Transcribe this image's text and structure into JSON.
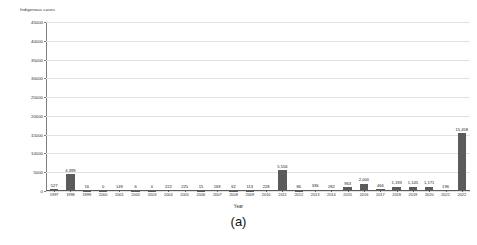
{
  "chart_data": {
    "type": "bar",
    "title": "",
    "xlabel": "Year",
    "ylabel": "Indigenous cases",
    "ylim": [
      0,
      45000
    ],
    "ytick_labels": [
      "0",
      "5000",
      "10000",
      "15000",
      "20000",
      "25000",
      "30000",
      "35000",
      "40000",
      "45000"
    ],
    "ytick_values": [
      0,
      5000,
      10000,
      15000,
      20000,
      25000,
      30000,
      35000,
      40000,
      45000
    ],
    "grid": true,
    "legend": "none",
    "bar_color": "#5b5b5b",
    "categories": [
      "1997",
      "1998",
      "1999",
      "2000",
      "2001",
      "2002",
      "2003",
      "2004",
      "2005",
      "2006",
      "2007",
      "2008",
      "2009",
      "2010",
      "2011",
      "2012",
      "2013",
      "2014",
      "2015",
      "2016",
      "2017",
      "2018",
      "2019",
      "2020",
      "2021",
      "2022"
    ],
    "values": [
      527,
      4399,
      16,
      0,
      149,
      6,
      0,
      222,
      225,
      15,
      169,
      62,
      113,
      228,
      5556,
      86,
      336,
      282,
      963,
      2000,
      466,
      1193,
      1145,
      1171,
      196,
      15458
    ],
    "value_labels": [
      "527",
      "4,399",
      "16",
      "0",
      "149",
      "6",
      "0",
      "222",
      "225",
      "15",
      "169",
      "62",
      "113",
      "228",
      "5,556",
      "86",
      "336",
      "282",
      "963",
      "2,000",
      "466",
      "1,193",
      "1,145",
      "1,171",
      "196",
      "15,458"
    ],
    "series_full": [
      {
        "year": "1997",
        "value": 527,
        "label": "527"
      },
      {
        "year": "1998",
        "value": 4399,
        "label": "4,399"
      },
      {
        "year": "1999",
        "value": 16,
        "label": "16"
      },
      {
        "year": "2000",
        "value": 0,
        "label": "0"
      },
      {
        "year": "2001",
        "value": 149,
        "label": "149"
      },
      {
        "year": "2002",
        "value": 6,
        "label": "6"
      },
      {
        "year": "2003",
        "value": 0,
        "label": "0"
      },
      {
        "year": "2004",
        "value": 222,
        "label": "222"
      },
      {
        "year": "2005",
        "value": 225,
        "label": "225"
      },
      {
        "year": "2006",
        "value": 15,
        "label": "15"
      },
      {
        "year": "2007",
        "value": 169,
        "label": "169"
      },
      {
        "year": "2008",
        "value": 62,
        "label": "62"
      },
      {
        "year": "2009",
        "value": 113,
        "label": "113"
      },
      {
        "year": "2010",
        "value": 228,
        "label": "228"
      },
      {
        "year": "2011",
        "value": 5556,
        "label": "5,556"
      },
      {
        "year": "2012",
        "value": 86,
        "label": "86"
      },
      {
        "year": "2013",
        "value": 336,
        "label": "336"
      },
      {
        "year": "2014",
        "value": 282,
        "label": "282"
      },
      {
        "year": "2015",
        "value": 963,
        "label": "963"
      },
      {
        "year": "2016",
        "value": 2000,
        "label": "2,000"
      },
      {
        "year": "2017",
        "value": 466,
        "label": "466"
      },
      {
        "year": "2018",
        "value": 1193,
        "label": "1,193"
      },
      {
        "year": "2019",
        "value": 1145,
        "label": "1,145"
      },
      {
        "year": "2020",
        "value": 1171,
        "label": "1,171"
      },
      {
        "year": "2021",
        "value": 196,
        "label": "196"
      },
      {
        "year": "2022",
        "value": 15458,
        "label": "15,458"
      }
    ]
  },
  "caption": "(a)"
}
